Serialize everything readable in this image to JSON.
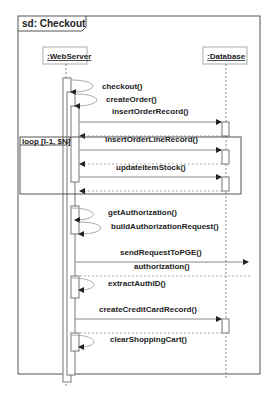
{
  "frame": {
    "title": "sd: Checkout"
  },
  "lifelines": [
    {
      "name": ":WebServer"
    },
    {
      "name": ":Database"
    }
  ],
  "loop": {
    "label": "loop [I-1, $N]"
  },
  "messages": [
    {
      "label": "checkout()",
      "type": "self"
    },
    {
      "label": "createOrder()",
      "type": "self"
    },
    {
      "label": "insertOrderRecord()",
      "type": "call",
      "to": ":Database"
    },
    {
      "label": "insertOrderLineRecord()",
      "type": "call",
      "to": ":Database"
    },
    {
      "label": "updateItemStock()",
      "type": "call",
      "to": ":Database"
    },
    {
      "label": "getAuthorization()",
      "type": "self"
    },
    {
      "label": "buildAuthorizationRequest()",
      "type": "self"
    },
    {
      "label": "sendRequestToPGE()",
      "type": "call",
      "to": "external"
    },
    {
      "label": "authorization()",
      "type": "return"
    },
    {
      "label": "extractAuthID()",
      "type": "self"
    },
    {
      "label": "createCreditCardRecord()",
      "type": "call",
      "to": ":Database"
    },
    {
      "label": "clearShoppingCart()",
      "type": "self"
    }
  ],
  "colors": {
    "line": "#555555",
    "text": "#222222"
  }
}
